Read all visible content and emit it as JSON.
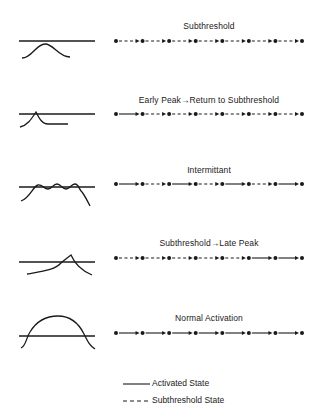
{
  "rows": [
    {
      "title": "Subthreshold",
      "title_y": 21,
      "line_y": 41,
      "waveform": "bell",
      "segments": [
        "dashed",
        "dashed",
        "dashed",
        "dashed",
        "dashed",
        "dashed",
        "dashed"
      ]
    },
    {
      "title": "Early Peak→Return to Subthreshold",
      "title_y": 95,
      "line_y": 114,
      "waveform": "early-peak",
      "segments": [
        "solid",
        "dashed",
        "dashed",
        "dashed",
        "dashed",
        "dashed",
        "dashed"
      ]
    },
    {
      "title": "Intermittant",
      "title_y": 165,
      "line_y": 184,
      "waveform": "oscillating",
      "segments": [
        "solid",
        "dashed",
        "solid",
        "dashed",
        "solid",
        "dashed",
        "solid"
      ]
    },
    {
      "title": "Subthreshold→Late Peak",
      "title_y": 238,
      "line_y": 258,
      "waveform": "late-peak",
      "segments": [
        "dashed",
        "dashed",
        "dashed",
        "dashed",
        "dashed",
        "solid",
        "solid"
      ]
    },
    {
      "title": "Normal Activation",
      "title_y": 313,
      "line_y": 333,
      "waveform": "plateau",
      "segments": [
        "solid",
        "solid",
        "solid",
        "solid",
        "solid",
        "solid",
        "solid"
      ]
    }
  ],
  "legend": {
    "activated_label": "Activated State",
    "subthreshold_label": "Subthreshold State"
  },
  "chain": {
    "x_start": 116,
    "x_end": 302,
    "dots": 8
  },
  "colors": {
    "ink": "#1a1a1a",
    "background": "#ffffff"
  }
}
